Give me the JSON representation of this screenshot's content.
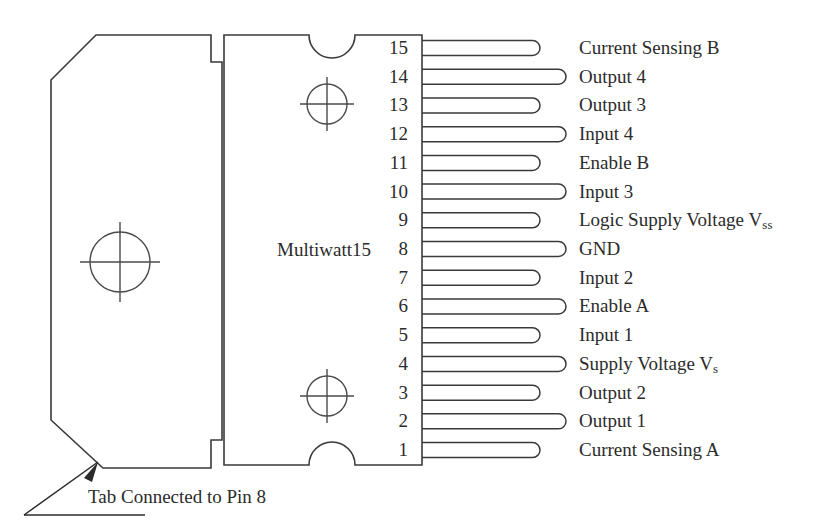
{
  "diagram": {
    "package_name": "Multiwatt15",
    "tab_note": "Tab Connected to Pin 8",
    "pin_count": 15,
    "stroke_color": "#3a3a3a",
    "background_color": "#ffffff",
    "pins": [
      {
        "number": "15",
        "label": "Current Sensing B",
        "label_html": "Current Sensing B",
        "lead_length": "short"
      },
      {
        "number": "14",
        "label": "Output 4",
        "label_html": "Output 4",
        "lead_length": "long"
      },
      {
        "number": "13",
        "label": "Output 3",
        "label_html": "Output 3",
        "lead_length": "short"
      },
      {
        "number": "12",
        "label": "Input 4",
        "label_html": "Input 4",
        "lead_length": "long"
      },
      {
        "number": "11",
        "label": "Enable B",
        "label_html": "Enable B",
        "lead_length": "short"
      },
      {
        "number": "10",
        "label": "Input 3",
        "label_html": "Input 3",
        "lead_length": "long"
      },
      {
        "number": "9",
        "label": "Logic Supply Voltage Vss",
        "label_html": "Logic Supply Voltage V<sub>ss</sub>",
        "lead_length": "short"
      },
      {
        "number": "8",
        "label": "GND",
        "label_html": "GND",
        "lead_length": "long"
      },
      {
        "number": "7",
        "label": "Input 2",
        "label_html": "Input 2",
        "lead_length": "short"
      },
      {
        "number": "6",
        "label": "Enable A",
        "label_html": "Enable A",
        "lead_length": "long"
      },
      {
        "number": "5",
        "label": "Input 1",
        "label_html": "Input 1",
        "lead_length": "short"
      },
      {
        "number": "4",
        "label": "Supply Voltage Vs",
        "label_html": "Supply Voltage V<sub>s</sub>",
        "lead_length": "long"
      },
      {
        "number": "3",
        "label": "Output 2",
        "label_html": "Output 2",
        "lead_length": "short"
      },
      {
        "number": "2",
        "label": "Output 1",
        "label_html": "Output 1",
        "lead_length": "long"
      },
      {
        "number": "1",
        "label": "Current Sensing A",
        "label_html": "Current Sensing A",
        "lead_length": "short"
      }
    ],
    "mounting_holes": [
      {
        "name": "tab-hole",
        "cx": 120,
        "cy": 262,
        "r": 30
      },
      {
        "name": "body-hole-top",
        "cx": 327,
        "cy": 104,
        "r": 20
      },
      {
        "name": "body-hole-bottom",
        "cx": 327,
        "cy": 396,
        "r": 20
      }
    ]
  }
}
